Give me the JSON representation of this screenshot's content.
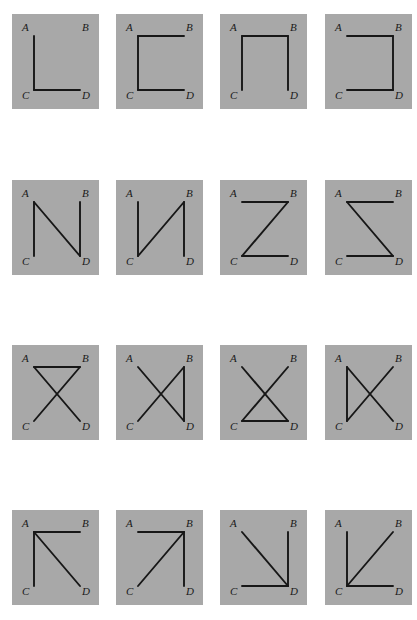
{
  "figure": {
    "kind": "graph-diagram-grid",
    "background_color": "#ffffff",
    "panel_color": "#a8a8a8",
    "edge_color": "#171717",
    "label_color": "#1a1a1a",
    "rows": 4,
    "columns": 4,
    "vertex_labels": [
      "A",
      "B",
      "C",
      "D"
    ],
    "vertex_positions": {
      "A": [
        22,
        22
      ],
      "B": [
        68,
        22
      ],
      "C": [
        22,
        76
      ],
      "D": [
        68,
        76
      ]
    }
  },
  "panels": [
    {
      "id": "r1c1",
      "row": 1,
      "col": 1,
      "edges": [
        "AC",
        "CD"
      ]
    },
    {
      "id": "r1c2",
      "row": 1,
      "col": 2,
      "edges": [
        "AB",
        "AC",
        "CD"
      ]
    },
    {
      "id": "r1c3",
      "row": 1,
      "col": 3,
      "edges": [
        "AB",
        "AC",
        "BD"
      ]
    },
    {
      "id": "r1c4",
      "row": 1,
      "col": 4,
      "edges": [
        "AB",
        "BD",
        "CD"
      ]
    },
    {
      "id": "r2c1",
      "row": 2,
      "col": 1,
      "edges": [
        "AC",
        "AD",
        "BD"
      ]
    },
    {
      "id": "r2c2",
      "row": 2,
      "col": 2,
      "edges": [
        "AC",
        "BC",
        "BD"
      ]
    },
    {
      "id": "r2c3",
      "row": 2,
      "col": 3,
      "edges": [
        "AB",
        "BC",
        "CD"
      ]
    },
    {
      "id": "r2c4",
      "row": 2,
      "col": 4,
      "edges": [
        "AB",
        "AD",
        "CD"
      ]
    },
    {
      "id": "r3c1",
      "row": 3,
      "col": 1,
      "edges": [
        "AB",
        "AD",
        "BC"
      ]
    },
    {
      "id": "r3c2",
      "row": 3,
      "col": 2,
      "edges": [
        "AD",
        "BC",
        "BD"
      ]
    },
    {
      "id": "r3c3",
      "row": 3,
      "col": 3,
      "edges": [
        "AD",
        "BC",
        "CD"
      ]
    },
    {
      "id": "r3c4",
      "row": 3,
      "col": 4,
      "edges": [
        "AC",
        "AD",
        "BC"
      ]
    },
    {
      "id": "r4c1",
      "row": 4,
      "col": 1,
      "edges": [
        "AB",
        "AC",
        "AD"
      ]
    },
    {
      "id": "r4c2",
      "row": 4,
      "col": 2,
      "edges": [
        "AB",
        "BC",
        "BD"
      ]
    },
    {
      "id": "r4c3",
      "row": 4,
      "col": 3,
      "edges": [
        "AD",
        "BD",
        "CD"
      ]
    },
    {
      "id": "r4c4",
      "row": 4,
      "col": 4,
      "edges": [
        "AC",
        "BC",
        "CD"
      ]
    }
  ],
  "layout": {
    "col_x": [
      12,
      116,
      220,
      325
    ],
    "row_y": [
      14,
      180,
      345,
      510
    ],
    "panel_width": 87,
    "panel_height": 95
  }
}
